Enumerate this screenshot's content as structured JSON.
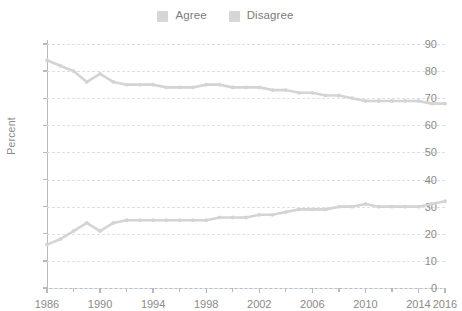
{
  "legend": {
    "position": "top-center",
    "entries": [
      {
        "label": "Agree",
        "color": "#d6d6d6",
        "swatch_icon": "square-swatch-icon"
      },
      {
        "label": "Disagree",
        "color": "#d6d6d6",
        "swatch_icon": "square-swatch-icon"
      }
    ]
  },
  "axes": {
    "ylabel": "Percent",
    "xlabel": "",
    "ytick_labels": [
      "0",
      "10",
      "20",
      "30",
      "40",
      "50",
      "60",
      "70",
      "80",
      "90"
    ],
    "xtick_labels": [
      "1986",
      "1990",
      "1994",
      "1998",
      "2002",
      "2006",
      "2010",
      "2014",
      "2016"
    ]
  },
  "style": {
    "grid_color": "#d9e2e8",
    "axis_color": "#b9b9b9",
    "tick_text_color": "#8a8a8a",
    "series_color_agree": "#d4d4d4",
    "series_color_disagree": "#d4d4d4"
  },
  "chart_data": {
    "type": "line",
    "title": "",
    "subtitle": "",
    "xlabel": "",
    "ylabel": "Percent",
    "xlim": [
      1986,
      2016
    ],
    "ylim": [
      0,
      90
    ],
    "ytick_step": 10,
    "grid": true,
    "grid_style": "dashed-horizontal",
    "legend_position": "top-center",
    "markers": true,
    "x": [
      1986,
      1987,
      1988,
      1989,
      1990,
      1991,
      1992,
      1993,
      1994,
      1995,
      1996,
      1997,
      1998,
      1999,
      2000,
      2001,
      2002,
      2003,
      2004,
      2005,
      2006,
      2007,
      2008,
      2009,
      2010,
      2011,
      2012,
      2013,
      2014,
      2015,
      2016
    ],
    "series": [
      {
        "name": "Agree",
        "color": "#d4d4d4",
        "values": [
          84,
          82,
          80,
          76,
          79,
          76,
          75,
          75,
          75,
          74,
          74,
          74,
          75,
          75,
          74,
          74,
          74,
          73,
          73,
          72,
          72,
          71,
          71,
          70,
          69,
          69,
          69,
          69,
          69,
          68,
          68
        ]
      },
      {
        "name": "Disagree",
        "color": "#d4d4d4",
        "values": [
          16,
          18,
          21,
          24,
          21,
          24,
          25,
          25,
          25,
          25,
          25,
          25,
          25,
          26,
          26,
          26,
          27,
          27,
          28,
          29,
          29,
          29,
          30,
          30,
          31,
          30,
          30,
          30,
          30,
          31,
          32
        ]
      }
    ],
    "annotations": []
  }
}
